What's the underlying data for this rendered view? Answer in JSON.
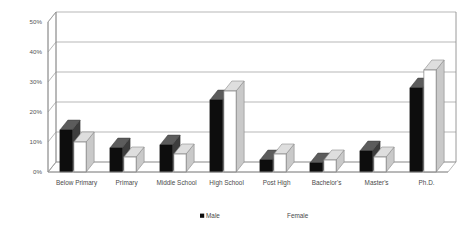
{
  "chart_data": {
    "type": "bar",
    "title": "",
    "subtitle": "",
    "xlabel": "",
    "ylabel": "",
    "ylim": [
      0,
      50
    ],
    "ytick_labels": [
      "0%",
      "10%",
      "20%",
      "30%",
      "40%",
      "50%"
    ],
    "ytick_values": [
      0,
      10,
      20,
      30,
      40,
      50
    ],
    "grid": true,
    "legend_position": "bottom-center",
    "style": "3d-clustered-column",
    "categories": [
      "Below Primary",
      "Primary",
      "Middle School",
      "High School",
      "Post High",
      "Bachelor's",
      "Master's",
      "Ph.D."
    ],
    "series": [
      {
        "name": "Male",
        "color": "#0d0d0d",
        "values": [
          14,
          8,
          9,
          24,
          4,
          3,
          7,
          28
        ]
      },
      {
        "name": "Female",
        "color": "#ffffff",
        "values": [
          10,
          5,
          6,
          27,
          6,
          4,
          5,
          34
        ]
      }
    ]
  },
  "legend": {
    "entries": [
      {
        "label": "Male",
        "marker": "filled-square",
        "color": "#0d0d0d"
      },
      {
        "label": "Female",
        "marker": "filled-square",
        "color": "#ffffff"
      }
    ]
  },
  "colors": {
    "background": "#ffffff",
    "gridline": "#9a9a9a",
    "axis": "#8e8e8e",
    "tick_text": "#4a4a4a",
    "male_front": "#0d0d0d",
    "male_side": "#3d3d3d",
    "male_top": "#5c5c5c",
    "female_front": "#ffffff",
    "female_side": "#c9c9c9",
    "female_top": "#dedede"
  }
}
